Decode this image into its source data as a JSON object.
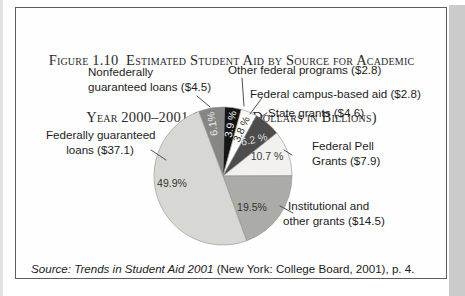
{
  "figure": {
    "title_line1": "Figure 1.10  Estimated Student Aid by Source for Academic",
    "title_line2": "Year 2000–2001 (Current Dollars in Billions)",
    "source_italic": "Source: Trends in Student Aid 2001",
    "source_rest": " (New York: College Board, 2001), p. 4."
  },
  "chart_data": {
    "type": "pie",
    "title": "Estimated Student Aid by Source for Academic Year 2000–2001 (Current Dollars in Billions)",
    "units": "billions of current dollars",
    "legend_position": "callout-labels",
    "start_angle_deg": -20.6,
    "slices": [
      {
        "label": "Nonfederally guaranteed loans",
        "amount_billions": 4.5,
        "percent": 6.1,
        "percent_label": "6.1%",
        "color": "#868684",
        "text_color": "#e8e8e6"
      },
      {
        "label": "Other federal programs",
        "amount_billions": 2.8,
        "percent": 3.9,
        "percent_label": "3.9 %",
        "color": "#151515",
        "text_color": "#f2f2f0"
      },
      {
        "label": "Federal campus-based aid",
        "amount_billions": 2.8,
        "percent": 3.8,
        "percent_label": "3.8 %",
        "color": "#fcfcfa",
        "text_color": "#2e2e2e"
      },
      {
        "label": "State grants",
        "amount_billions": 4.6,
        "percent": 6.2,
        "percent_label": "6.2 %",
        "color": "#4c4c4c",
        "text_color": "#dededc"
      },
      {
        "label": "Federal Pell Grants",
        "amount_billions": 7.9,
        "percent": 10.7,
        "percent_label": "10.7 %",
        "color": "#f2f1ed",
        "text_color": "#3a3a3a"
      },
      {
        "label": "Institutional and other grants",
        "amount_billions": 14.5,
        "percent": 19.5,
        "percent_label": "19.5%",
        "color": "#ababa8",
        "text_color": "#333330"
      },
      {
        "label": "Federally guaranteed loans",
        "amount_billions": 37.1,
        "percent": 49.9,
        "percent_label": "49.9%",
        "color": "#d7d7d4",
        "text_color": "#333330"
      }
    ],
    "callouts": [
      {
        "lines": [
          "Nonfederally",
          "guaranteed loans ($4.5)"
        ]
      },
      {
        "lines": [
          "Other federal programs ($2.8)"
        ]
      },
      {
        "lines": [
          "Federal campus-based aid ($2.8)"
        ]
      },
      {
        "lines": [
          "State grants ($4.6)"
        ]
      },
      {
        "lines": [
          "Federal Pell",
          "Grants ($7.9)"
        ]
      },
      {
        "lines": [
          "Institutional and",
          "other grants ($14.5)"
        ]
      },
      {
        "lines": [
          "Federally guaranteed",
          "loans ($37.1)"
        ]
      }
    ]
  }
}
